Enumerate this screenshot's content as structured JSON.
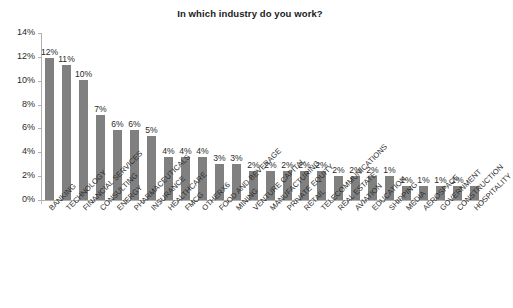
{
  "chart_data": {
    "type": "bar",
    "title": "In which industry do you work?",
    "xlabel": "",
    "ylabel": "",
    "ylim": [
      0,
      14
    ],
    "ytick_labels": [
      "0%",
      "2%",
      "4%",
      "6%",
      "8%",
      "10%",
      "12%",
      "14%"
    ],
    "ytick_values": [
      0,
      2,
      4,
      6,
      8,
      10,
      12,
      14
    ],
    "grid": false,
    "legend": false,
    "bar_color": "#808080",
    "categories": [
      "BANKING",
      "TECHNOLOGY",
      "FINANCIAL SERVICES",
      "CONSULTING",
      "ENERGY",
      "PHARMACEUTICALS",
      "INSURANCE",
      "HEALTHCARE",
      "FMCG",
      "OTHERX6",
      "FOOD AND BEVERAGE",
      "MINING",
      "VENTURE CAPITAL",
      "MANUFACTURING",
      "PRIVATE EQUITY",
      "RETAIL",
      "TELECOMMUNICATIONS",
      "REAL ESTATE",
      "AVIATION",
      "EDUCATION",
      "SHIPPING",
      "MEDIA",
      "AEROSPACE",
      "GOVERNMENT",
      "CONSTRUCTION",
      "HOSPITALITY"
    ],
    "values": [
      11.9,
      11.3,
      10.1,
      7.1,
      5.9,
      5.9,
      5.4,
      3.6,
      3.6,
      3.6,
      3.0,
      3.0,
      2.4,
      2.4,
      2.4,
      2.4,
      2.4,
      2.0,
      2.0,
      2.0,
      2.0,
      1.2,
      1.2,
      1.2,
      1.2,
      1.2
    ],
    "data_labels": [
      "12%",
      "11%",
      "10%",
      "7%",
      "6%",
      "6%",
      "5%",
      "4%",
      "4%",
      "4%",
      "3%",
      "3%",
      "2%",
      "2%",
      "2%",
      "2%",
      "2%",
      "2%",
      "2%",
      "2%",
      "1%",
      "1%",
      "1%",
      "1%",
      "1%"
    ]
  }
}
